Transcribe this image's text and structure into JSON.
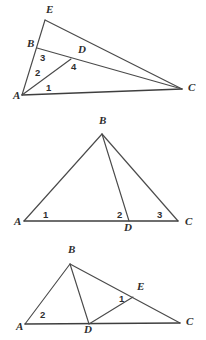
{
  "document": {
    "title": "Geometry figures: three labeled triangle diagrams",
    "background_color": "#ffffff",
    "line_color": "#4a4a4a",
    "label_color": "#2e2e2e"
  },
  "figures": [
    {
      "id": "figure-1",
      "description": "Triangle A E C with point B on AE and point D inside; segments AD, AB, BD extended, AC base, and angles 1,2,3,4 marked near A and D",
      "vertex_labels": [
        {
          "name": "E",
          "text": "E",
          "x": 46,
          "y": 13
        },
        {
          "name": "B",
          "text": "B",
          "x": 27,
          "y": 47
        },
        {
          "name": "D",
          "text": "D",
          "x": 78,
          "y": 53
        },
        {
          "name": "A",
          "text": "A",
          "x": 13,
          "y": 99
        },
        {
          "name": "C",
          "text": "C",
          "x": 188,
          "y": 91
        }
      ],
      "angle_labels": [
        {
          "name": "angle-1",
          "text": "1",
          "x": 46,
          "y": 91
        },
        {
          "name": "angle-2",
          "text": "2",
          "x": 35,
          "y": 76
        },
        {
          "name": "angle-3",
          "text": "3",
          "x": 40,
          "y": 61
        },
        {
          "name": "angle-4",
          "text": "4",
          "x": 71,
          "y": 70
        }
      ],
      "points": {
        "E": [
          45,
          20
        ],
        "B": [
          37,
          48
        ],
        "D": [
          71,
          59
        ],
        "A": [
          22,
          95
        ],
        "C": [
          182,
          89
        ]
      },
      "segments": [
        {
          "name": "segment-A-E",
          "from": "A",
          "to": "E"
        },
        {
          "name": "segment-E-C",
          "from": "E",
          "to": "C"
        },
        {
          "name": "segment-A-C",
          "from": "A",
          "to": "C"
        },
        {
          "name": "segment-B-C",
          "from": "B",
          "to": "C"
        },
        {
          "name": "segment-A-D",
          "from": "A",
          "to": "D"
        }
      ]
    },
    {
      "id": "figure-2",
      "description": "Triangle A B C with cevian B D drawn to base AC; angles 1 at A, 2 and 3 at D and C",
      "vertex_labels": [
        {
          "name": "B",
          "text": "B",
          "x": 99,
          "y": 12
        },
        {
          "name": "A",
          "text": "A",
          "x": 14,
          "y": 113
        },
        {
          "name": "D",
          "text": "D",
          "x": 124,
          "y": 119
        },
        {
          "name": "C",
          "text": "C",
          "x": 185,
          "y": 113
        }
      ],
      "angle_labels": [
        {
          "name": "angle-1",
          "text": "1",
          "x": 43,
          "y": 106
        },
        {
          "name": "angle-2",
          "text": "2",
          "x": 117,
          "y": 106
        },
        {
          "name": "angle-3",
          "text": "3",
          "x": 157,
          "y": 106
        }
      ],
      "points": {
        "B": [
          102,
          22
        ],
        "A": [
          24,
          109
        ],
        "D": [
          129,
          109
        ],
        "C": [
          178,
          109
        ]
      },
      "segments": [
        {
          "name": "segment-A-B",
          "from": "A",
          "to": "B"
        },
        {
          "name": "segment-B-C",
          "from": "B",
          "to": "C"
        },
        {
          "name": "segment-A-C",
          "from": "A",
          "to": "C"
        },
        {
          "name": "segment-B-D",
          "from": "B",
          "to": "D"
        }
      ]
    },
    {
      "id": "figure-3",
      "description": "Triangle A B C with point D on base AC and point E on side BC; segments B D and D E drawn; angle 1 at E and angle 2 at A",
      "vertex_labels": [
        {
          "name": "B",
          "text": "B",
          "x": 68,
          "y": 13
        },
        {
          "name": "E",
          "text": "E",
          "x": 137,
          "y": 50
        },
        {
          "name": "A",
          "text": "A",
          "x": 16,
          "y": 90
        },
        {
          "name": "D",
          "text": "D",
          "x": 84,
          "y": 93
        },
        {
          "name": "C",
          "text": "C",
          "x": 186,
          "y": 85
        }
      ],
      "angle_labels": [
        {
          "name": "angle-1",
          "text": "1",
          "x": 119,
          "y": 62
        },
        {
          "name": "angle-2",
          "text": "2",
          "x": 40,
          "y": 78
        }
      ],
      "points": {
        "B": [
          70,
          24
        ],
        "E": [
          133,
          57
        ],
        "A": [
          25,
          84
        ],
        "D": [
          89,
          84
        ],
        "C": [
          180,
          83
        ]
      },
      "segments": [
        {
          "name": "segment-A-B",
          "from": "A",
          "to": "B"
        },
        {
          "name": "segment-B-C",
          "from": "B",
          "to": "C"
        },
        {
          "name": "segment-A-C",
          "from": "A",
          "to": "C"
        },
        {
          "name": "segment-B-D",
          "from": "B",
          "to": "D"
        },
        {
          "name": "segment-D-E",
          "from": "D",
          "to": "E"
        }
      ]
    }
  ]
}
